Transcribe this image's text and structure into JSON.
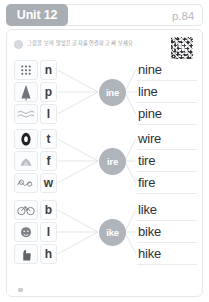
{
  "header": {
    "unit_label": "Unit 12",
    "page_label": "p.84"
  },
  "instruction": {
    "text": "그림을 보며 알맞은 글자를 연결하고 써 보세요.",
    "bullet_icon": "circle-bullet-icon",
    "qr_icon": "qr-code-icon"
  },
  "groups": [
    {
      "rime": "ine",
      "tiles": [
        {
          "letter": "n",
          "picture_icon": "nine-dots-icon"
        },
        {
          "letter": "p",
          "picture_icon": "pine-tree-icon"
        },
        {
          "letter": "l",
          "picture_icon": "line-wave-icon"
        }
      ],
      "words": [
        "nine",
        "line",
        "pine"
      ]
    },
    {
      "rime": "ire",
      "tiles": [
        {
          "letter": "t",
          "picture_icon": "tire-icon"
        },
        {
          "letter": "f",
          "picture_icon": "fire-icon"
        },
        {
          "letter": "w",
          "picture_icon": "wire-icon"
        }
      ],
      "words": [
        "wire",
        "tire",
        "fire"
      ]
    },
    {
      "rime": "ike",
      "tiles": [
        {
          "letter": "b",
          "picture_icon": "bike-icon"
        },
        {
          "letter": "l",
          "picture_icon": "like-face-icon"
        },
        {
          "letter": "h",
          "picture_icon": "hike-thumb-icon"
        }
      ],
      "words": [
        "like",
        "bike",
        "hike"
      ]
    }
  ],
  "footer": {
    "page_mark_icon": "page-corner-mark-icon"
  },
  "colors": {
    "badge": "#a9aeb4",
    "circle": "#b0b5bb",
    "border": "#e6e9ec",
    "text": "#2f3237",
    "muted": "#b5babf"
  }
}
